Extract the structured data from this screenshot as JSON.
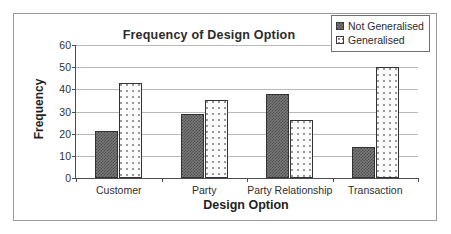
{
  "chart_data": {
    "type": "bar",
    "title": "Frequency of Design Option",
    "xlabel": "Design Option",
    "ylabel": "Frequency",
    "categories": [
      "Customer",
      "Party",
      "Party Relationship",
      "Transaction"
    ],
    "series": [
      {
        "name": "Not Generalised",
        "values": [
          21,
          29,
          38,
          14
        ],
        "fill": "dark-checker",
        "color": "#7c7c7c"
      },
      {
        "name": "Generalised",
        "values": [
          43,
          35,
          26,
          50
        ],
        "fill": "light-dotted",
        "color": "#fbfbfb"
      }
    ],
    "ylim": [
      0,
      60
    ],
    "yticks": [
      0,
      10,
      20,
      30,
      40,
      50,
      60
    ],
    "ytick_labels": [
      "0",
      "10",
      "20",
      "30",
      "40",
      "50",
      "60"
    ],
    "grid": "horizontal",
    "legend_position": "top-right",
    "legend_entries": [
      "Not Generalised",
      "Generalised"
    ],
    "border": "outer frame box"
  }
}
